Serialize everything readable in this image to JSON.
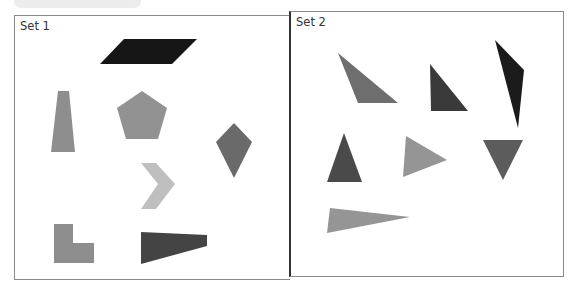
{
  "sets": [
    {
      "title": "Set 1",
      "shapes": [
        {
          "name": "parallelogram",
          "color": "#161616",
          "points": "100,64 124,39 197,39 172,64"
        },
        {
          "name": "trapezoid",
          "color": "#8e8e8e",
          "points": "58,91 69,91 75,152 51,152"
        },
        {
          "name": "pentagon",
          "color": "#929292",
          "points": "142,91 167,108 158,139 126,139 117,108"
        },
        {
          "name": "kite",
          "color": "#6a6a6a",
          "points": "234,123 252,142 234,178 216,142"
        },
        {
          "name": "chevron",
          "color": "#bfbfbf",
          "points": "141,163 156,163 175,184 156,209 141,209 158,184"
        },
        {
          "name": "l-shape",
          "color": "#8e8e8e",
          "points": "54,224 73,224 73,243 94,243 94,263 54,263"
        },
        {
          "name": "quadrilateral-wedge",
          "color": "#444444",
          "points": "141,232 207,235 207,246 141,264"
        }
      ]
    },
    {
      "title": "Set 2",
      "shapes": [
        {
          "name": "obtuse-triangle",
          "color": "#6e6e6e",
          "points": "338,53 398,103 358,103"
        },
        {
          "name": "right-triangle",
          "color": "#3a3a3a",
          "points": "430,64 468,111 431,111"
        },
        {
          "name": "sliver-triangle",
          "color": "#1b1b1b",
          "points": "495,40 524,70 518,128"
        },
        {
          "name": "acute-triangle",
          "color": "#4a4a4a",
          "points": "344,133 362,182 327,182"
        },
        {
          "name": "right-pointing-triangle",
          "color": "#959595",
          "points": "406,136 447,160 403,177"
        },
        {
          "name": "inverted-triangle",
          "color": "#5c5c5c",
          "points": "483,140 523,140 503,180"
        },
        {
          "name": "long-thin-triangle",
          "color": "#959595",
          "points": "330,208 410,217 327,233"
        }
      ]
    }
  ]
}
